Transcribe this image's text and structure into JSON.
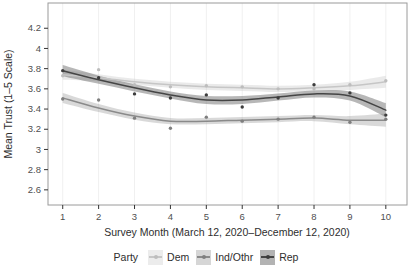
{
  "colors": {
    "panel_border": "#9a9a9a",
    "tick_mark": "#333333",
    "axis_text": "#4f4f4f",
    "title_text": "#2e2e2e",
    "grid": "#f0f0f0",
    "background": "#ffffff"
  },
  "chart_data": {
    "type": "line",
    "title": "",
    "xlabel": "Survey Month (March 12, 2020–December 12, 2020)",
    "ylabel": "Mean Trust (1–5 Scale)",
    "x": [
      1,
      2,
      3,
      4,
      5,
      6,
      7,
      8,
      9,
      10
    ],
    "xtick_labels": [
      "1",
      "2",
      "3",
      "4",
      "5",
      "6",
      "7",
      "8",
      "9",
      "10"
    ],
    "ytick_values": [
      2.6,
      2.8,
      3.0,
      3.2,
      3.4,
      3.6,
      3.8,
      4.0,
      4.2
    ],
    "ytick_labels": [
      "2.6",
      "2.8",
      "3",
      "3.2",
      "3.4",
      "3.6",
      "3.8",
      "4",
      "4.2"
    ],
    "xlim": [
      0.59,
      10.59
    ],
    "ylim": [
      2.45,
      4.45
    ],
    "grid_vertical": true,
    "grid_horizontal": false,
    "legend": {
      "title": "Party",
      "position": "bottom"
    },
    "series": [
      {
        "name": "Dem",
        "line_color": "#c6c6c6",
        "point_color": "#bdbdbd",
        "ribbon_fill": "#c4c4c4",
        "ribbon_opacity": 0.35,
        "swatch_bg": "#ececec",
        "points": [
          3.73,
          3.79,
          3.64,
          3.62,
          3.63,
          3.62,
          3.6,
          3.6,
          3.64,
          3.68
        ],
        "smooth": [
          3.74,
          3.71,
          3.67,
          3.64,
          3.62,
          3.61,
          3.6,
          3.61,
          3.63,
          3.67
        ],
        "ci_halfwidth": [
          0.05,
          0.035,
          0.03,
          0.03,
          0.03,
          0.03,
          0.03,
          0.03,
          0.04,
          0.06
        ]
      },
      {
        "name": "Ind/Othr",
        "line_color": "#8a8a8a",
        "point_color": "#7f7f7f",
        "ribbon_fill": "#9a9a9a",
        "ribbon_opacity": 0.38,
        "swatch_bg": "#d6d6d6",
        "points": [
          3.5,
          3.49,
          3.31,
          3.21,
          3.32,
          3.28,
          3.3,
          3.32,
          3.27,
          3.3
        ],
        "smooth": [
          3.51,
          3.41,
          3.33,
          3.28,
          3.28,
          3.29,
          3.3,
          3.31,
          3.29,
          3.29
        ],
        "ci_halfwidth": [
          0.05,
          0.04,
          0.035,
          0.03,
          0.03,
          0.03,
          0.03,
          0.03,
          0.04,
          0.065
        ]
      },
      {
        "name": "Rep",
        "line_color": "#454545",
        "point_color": "#3d3d3d",
        "ribbon_fill": "#6f6f6f",
        "ribbon_opacity": 0.5,
        "swatch_bg": "#b3b3b3",
        "points": [
          3.78,
          3.71,
          3.55,
          3.51,
          3.54,
          3.42,
          3.51,
          3.64,
          3.56,
          3.34
        ],
        "smooth": [
          3.78,
          3.69,
          3.61,
          3.54,
          3.49,
          3.49,
          3.52,
          3.55,
          3.53,
          3.39
        ],
        "ci_halfwidth": [
          0.055,
          0.04,
          0.035,
          0.035,
          0.04,
          0.04,
          0.035,
          0.035,
          0.045,
          0.07
        ]
      }
    ]
  }
}
